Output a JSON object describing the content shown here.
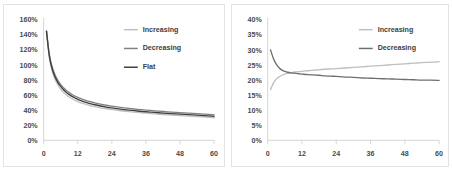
{
  "figure": {
    "background_color": "#ffffff",
    "panel_border_color": "#e3e3e3"
  },
  "chart_data": [
    {
      "type": "line",
      "title": "",
      "subtitle": "",
      "xlabel": "",
      "ylabel": "",
      "panel": "left",
      "grid": false,
      "legend_position": "top-right",
      "xlim": [
        0,
        60
      ],
      "ylim": [
        0,
        1.6
      ],
      "y_tick_format": "percent",
      "x_ticks": [
        0,
        12,
        24,
        36,
        48,
        60
      ],
      "x_tick_labels": [
        "0",
        "12",
        "24",
        "36",
        "48",
        "60"
      ],
      "y_ticks": [
        0,
        0.2,
        0.4,
        0.6,
        0.8,
        1.0,
        1.2,
        1.4,
        1.6
      ],
      "y_tick_labels": [
        "0%",
        "20%",
        "40%",
        "60%",
        "80%",
        "100%",
        "120%",
        "140%",
        "160%"
      ],
      "x": [
        1,
        2,
        3,
        4,
        5,
        6,
        7,
        8,
        9,
        10,
        11,
        12,
        14,
        16,
        18,
        20,
        22,
        24,
        27,
        30,
        33,
        36,
        39,
        42,
        45,
        48,
        51,
        54,
        57,
        60
      ],
      "series": [
        {
          "name": "Increasing",
          "color": "#bfbfbf",
          "values": [
            1.45,
            1.1,
            0.92,
            0.81,
            0.735,
            0.68,
            0.637,
            0.603,
            0.575,
            0.552,
            0.532,
            0.515,
            0.487,
            0.465,
            0.447,
            0.432,
            0.419,
            0.408,
            0.393,
            0.381,
            0.37,
            0.36,
            0.351,
            0.343,
            0.336,
            0.329,
            0.322,
            0.316,
            0.31,
            0.3
          ]
        },
        {
          "name": "Decreasing",
          "color": "#808080",
          "values": [
            1.45,
            1.14,
            0.975,
            0.87,
            0.795,
            0.74,
            0.697,
            0.662,
            0.633,
            0.609,
            0.588,
            0.57,
            0.54,
            0.516,
            0.497,
            0.48,
            0.466,
            0.454,
            0.438,
            0.424,
            0.412,
            0.402,
            0.392,
            0.383,
            0.375,
            0.368,
            0.361,
            0.354,
            0.348,
            0.338
          ]
        },
        {
          "name": "Flat",
          "color": "#3f3f3f",
          "values": [
            1.45,
            1.12,
            0.95,
            0.845,
            0.77,
            0.715,
            0.671,
            0.636,
            0.607,
            0.583,
            0.562,
            0.544,
            0.514,
            0.491,
            0.472,
            0.456,
            0.442,
            0.43,
            0.414,
            0.401,
            0.389,
            0.379,
            0.37,
            0.362,
            0.354,
            0.347,
            0.341,
            0.334,
            0.328,
            0.318
          ]
        }
      ]
    },
    {
      "type": "line",
      "title": "",
      "subtitle": "",
      "xlabel": "",
      "ylabel": "",
      "panel": "right",
      "grid": false,
      "legend_position": "top-right",
      "xlim": [
        0,
        60
      ],
      "ylim": [
        0,
        0.4
      ],
      "y_tick_format": "percent",
      "x_ticks": [
        0,
        12,
        24,
        36,
        48,
        60
      ],
      "x_tick_labels": [
        "0",
        "12",
        "24",
        "36",
        "48",
        "60"
      ],
      "y_ticks": [
        0,
        0.05,
        0.1,
        0.15,
        0.2,
        0.25,
        0.3,
        0.35,
        0.4
      ],
      "y_tick_labels": [
        "0%",
        "5%",
        "10%",
        "15%",
        "20%",
        "25%",
        "30%",
        "35%",
        "40%"
      ],
      "x": [
        1,
        2,
        3,
        4,
        5,
        6,
        7,
        8,
        9,
        10,
        11,
        12,
        14,
        16,
        18,
        20,
        22,
        24,
        27,
        30,
        33,
        36,
        39,
        42,
        45,
        48,
        51,
        54,
        57,
        60
      ],
      "series": [
        {
          "name": "Increasing",
          "color": "#bfbfbf",
          "values": [
            0.168,
            0.19,
            0.203,
            0.211,
            0.216,
            0.22,
            0.222,
            0.224,
            0.226,
            0.227,
            0.228,
            0.229,
            0.231,
            0.233,
            0.234,
            0.236,
            0.237,
            0.238,
            0.24,
            0.242,
            0.244,
            0.246,
            0.248,
            0.25,
            0.252,
            0.254,
            0.256,
            0.258,
            0.259,
            0.261
          ]
        },
        {
          "name": "Decreasing",
          "color": "#6e6e6e",
          "values": [
            0.3,
            0.272,
            0.253,
            0.241,
            0.233,
            0.229,
            0.226,
            0.224,
            0.223,
            0.222,
            0.221,
            0.22,
            0.218,
            0.217,
            0.216,
            0.214,
            0.213,
            0.212,
            0.21,
            0.209,
            0.207,
            0.206,
            0.205,
            0.204,
            0.203,
            0.202,
            0.201,
            0.2,
            0.2,
            0.199
          ]
        }
      ]
    }
  ]
}
